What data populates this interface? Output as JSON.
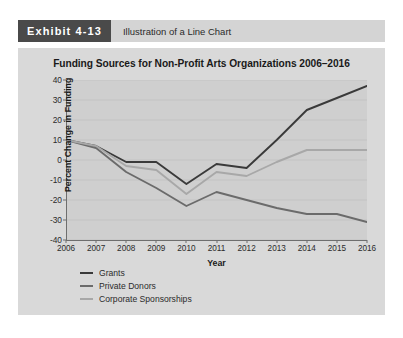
{
  "exhibit": {
    "badge": "Exhibit 4-13",
    "caption": "Illustration of a Line Chart",
    "badge_bg": "#4a4a4a",
    "header_bg": "#d4d4d4",
    "card_bg": "#d9d9d9"
  },
  "chart_data": {
    "type": "line",
    "title": "Funding Sources for Non-Profit Arts Organizations 2006–2016",
    "xlabel": "Year",
    "ylabel": "Percent Change in Funding",
    "grid": true,
    "legend_position": "bottom-left",
    "plot_bg": "#cfcfcf",
    "categories": [
      "2006",
      "2007",
      "2008",
      "2009",
      "2010",
      "2011",
      "2012",
      "2013",
      "2014",
      "2015",
      "2016"
    ],
    "x": [
      2006,
      2007,
      2008,
      2009,
      2010,
      2011,
      2012,
      2013,
      2014,
      2015,
      2016
    ],
    "xlim": [
      2006,
      2016
    ],
    "ylim": [
      -40,
      40
    ],
    "yticks": [
      40,
      30,
      20,
      10,
      0,
      -10,
      -20,
      -30,
      -40
    ],
    "series": [
      {
        "name": "Grants",
        "color": "#3a3a3a",
        "values": [
          10,
          7,
          -1,
          -1,
          -12,
          -2,
          -4,
          10,
          25,
          31,
          37
        ]
      },
      {
        "name": "Private Donors",
        "color": "#6b6b6b",
        "values": [
          10,
          6,
          -6,
          -14,
          -23,
          -16,
          -20,
          -24,
          -27,
          -27,
          -31
        ]
      },
      {
        "name": "Corporate Sponsorships",
        "color": "#a8a8a8",
        "values": [
          10,
          7,
          -3,
          -5,
          -17,
          -6,
          -8,
          -1,
          5,
          5,
          5
        ]
      }
    ]
  }
}
